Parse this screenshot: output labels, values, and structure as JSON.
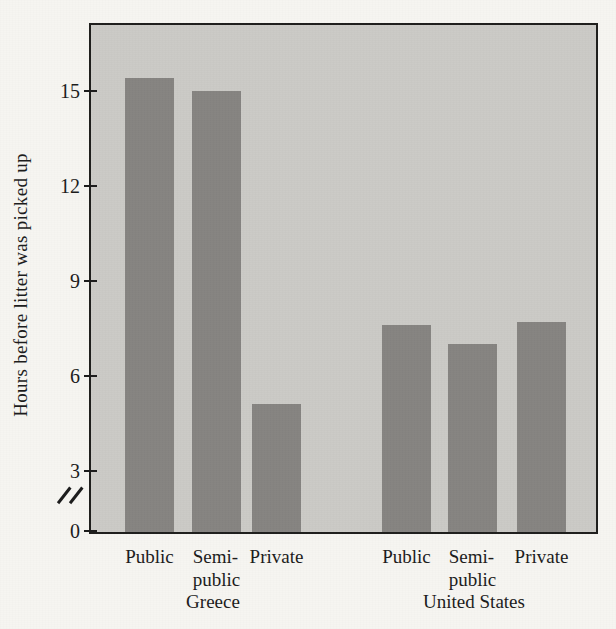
{
  "colors": {
    "page_background": "#f6f5f1",
    "plot_background": "#cbcac6",
    "bar": "#868481",
    "ink": "#1b1b1b"
  },
  "chart_data": {
    "type": "bar",
    "title": "",
    "ylabel": "Hours before litter was picked up",
    "xlabel": "",
    "yticks": [
      0,
      3,
      6,
      9,
      12,
      15
    ],
    "ylim": [
      0,
      16.2
    ],
    "grid": false,
    "y_axis_break": {
      "between_values": [
        0,
        3
      ]
    },
    "groups": [
      {
        "label": "Greece",
        "bars": [
          {
            "category": "Public",
            "category_lines": [
              "Public"
            ],
            "value": 15.4
          },
          {
            "category": "Semi-public",
            "category_lines": [
              "Semi-",
              "public"
            ],
            "value": 15.0
          },
          {
            "category": "Private",
            "category_lines": [
              "Private"
            ],
            "value": 5.1
          }
        ]
      },
      {
        "label": "United States",
        "bars": [
          {
            "category": "Public",
            "category_lines": [
              "Public"
            ],
            "value": 7.6
          },
          {
            "category": "Semi-public",
            "category_lines": [
              "Semi-",
              "public"
            ],
            "value": 7.0
          },
          {
            "category": "Private",
            "category_lines": [
              "Private"
            ],
            "value": 7.7
          }
        ]
      }
    ]
  }
}
